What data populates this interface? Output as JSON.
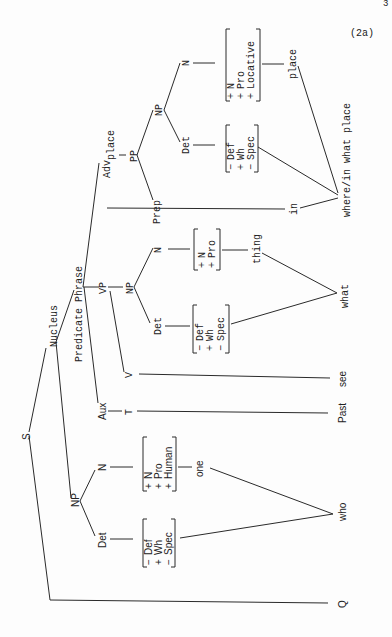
{
  "example_number": "(2a)",
  "page_mark": "3",
  "tree": {
    "root": "S",
    "nucleus": "Nucleus",
    "predicate_phrase": "Predicate Phrase",
    "adv": "Adv",
    "adv_sub": "place",
    "pp": "PP",
    "np_pp": "NP",
    "prep": "Prep",
    "n_pp": "N",
    "det_pp": "Det",
    "vp": "VP",
    "np_vp": "NP",
    "n_vp": "N",
    "det_vp": "Det",
    "v": "V",
    "aux": "Aux",
    "t": "T",
    "np_subj": "NP",
    "n_subj": "N",
    "det_subj": "Det"
  },
  "features": {
    "place_n": [
      [
        "+",
        "N"
      ],
      [
        "+",
        "Pro"
      ],
      [
        "+",
        "Locative"
      ]
    ],
    "place_det": [
      [
        "−",
        "Def"
      ],
      [
        "+",
        "Wh"
      ],
      [
        "−",
        "Spec"
      ]
    ],
    "thing_n": [
      [
        "+",
        "N"
      ],
      [
        "+",
        "Pro"
      ]
    ],
    "thing_det": [
      [
        "−",
        "Def"
      ],
      [
        "+",
        "Wh"
      ],
      [
        "−",
        "Spec"
      ]
    ],
    "one_n": [
      [
        "+",
        "N"
      ],
      [
        "+",
        "Pro"
      ],
      [
        "+",
        "Human"
      ]
    ],
    "one_det": [
      [
        "−",
        "Def"
      ],
      [
        "+",
        "Wh"
      ],
      [
        "−",
        "Spec"
      ]
    ]
  },
  "lexical": {
    "place": "place",
    "in": "in",
    "thing": "thing",
    "one": "one"
  },
  "surface": {
    "where": "where/in what place",
    "what": "what",
    "see": "see",
    "past": "Past",
    "who": "who",
    "q": "Q"
  }
}
